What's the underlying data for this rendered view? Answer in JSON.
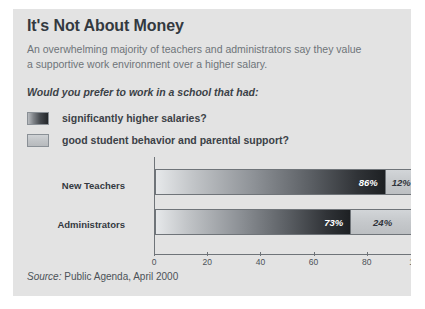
{
  "figure": {
    "title": "It's Not About Money",
    "subtitle": "An overwhelming majority of teachers and administrators say they value a supportive work environment over a higher salary.",
    "question": "Would you prefer to work in a school that had:",
    "source_word": "Source:",
    "source_text": " Public Agenda, April 2000",
    "background_color": "#e3e3e3",
    "panel_color": "#ffffff"
  },
  "legend": {
    "items": [
      {
        "label": "significantly higher salaries?",
        "swatch": "dark-gradient",
        "color": "#232629"
      },
      {
        "label": "good student behavior and parental support?",
        "swatch": "light-gray",
        "color": "#c5c8cb"
      }
    ]
  },
  "chart_data": {
    "type": "bar",
    "orientation": "horizontal",
    "stacked": true,
    "title": "It's Not About Money",
    "subtitle": "An overwhelming majority of teachers and administrators say they value a supportive work environment over a higher salary.",
    "question": "Would you prefer to work in a school that had:",
    "categories": [
      "New Teachers",
      "Administrators"
    ],
    "series": [
      {
        "name": "significantly higher salaries?",
        "values": [
          86,
          12
        ],
        "note": "not used; see stacked_rows"
      }
    ],
    "stacked_rows": [
      {
        "category": "New Teachers",
        "segments": [
          {
            "name": "significantly higher salaries?",
            "value": 86,
            "label": "86%",
            "style": "dark"
          },
          {
            "name": "good student behavior and parental support?",
            "value": 12,
            "label": "12%",
            "style": "light"
          }
        ]
      },
      {
        "category": "Administrators",
        "segments": [
          {
            "name": "significantly higher salaries?",
            "value": 73,
            "label": "73%",
            "style": "dark"
          },
          {
            "name": "good student behavior and parental support?",
            "value": 24,
            "label": "24%",
            "style": "light"
          }
        ]
      }
    ],
    "xlabel": "",
    "ylabel": "",
    "xlim": [
      0,
      100
    ],
    "xticks": [
      0,
      20,
      40,
      60,
      80,
      100
    ],
    "xtick_labels": [
      "0",
      "20",
      "40",
      "60",
      "80",
      "100%"
    ],
    "grid": false,
    "legend_position": "above-plot",
    "source": "Source: Public Agenda, April 2000"
  }
}
